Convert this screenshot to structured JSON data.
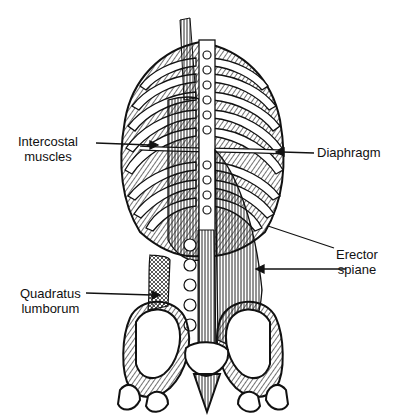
{
  "diagram": {
    "colors": {
      "ink": "#111111",
      "background": "#ffffff"
    },
    "labels": [
      {
        "id": "intercostal",
        "line1": "Intercostal",
        "line2": "muscles"
      },
      {
        "id": "diaphragm",
        "line1": "Diaphragm",
        "line2": ""
      },
      {
        "id": "erector",
        "line1": "Erector",
        "line2": "spiane"
      },
      {
        "id": "quadratus",
        "line1": "Quadratus",
        "line2": "lumborum"
      }
    ]
  }
}
